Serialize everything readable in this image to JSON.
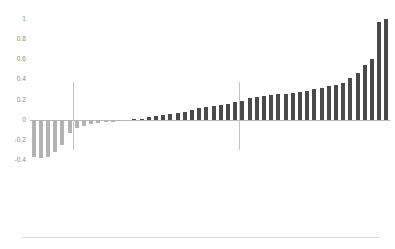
{
  "chart_data": {
    "type": "bar",
    "title": "",
    "subtitle": "",
    "xlabel": "",
    "ylabel": "",
    "ylim": [
      -0.4,
      1.05
    ],
    "yticks": [
      1,
      0.8,
      0.6,
      0.4,
      0.2,
      0,
      -0.2,
      -0.4
    ],
    "ytick_labels": [
      "1",
      "0.8",
      "0.6",
      "0.4",
      "0.2",
      "0",
      "-0.2",
      "-0.4"
    ],
    "grid": false,
    "legend": null,
    "orientation": "vertical",
    "sorted": true,
    "colors": {
      "negative_bar": "#b3b3b3",
      "positive_bar": "#4a4a4a",
      "zero_line": "#b9b9b9",
      "separator_line": "#c2c2c2",
      "tick_text": "#8c8c8c",
      "label_text": "#9a9a9a",
      "background": "#ffffff",
      "footer_rule": "#d9d9d9"
    },
    "separators": [
      {
        "name": "separator-left",
        "after_category_index": 6
      },
      {
        "name": "separator-right",
        "after_category_index": 29
      }
    ],
    "categories": [
      "category-01",
      "category-02",
      "category-03",
      "category-04",
      "category-05",
      "category-06",
      "category-07",
      "category-08",
      "category-09",
      "category-10",
      "category-11",
      "category-12",
      "category-13",
      "category-14",
      "category-15",
      "category-16",
      "category-17",
      "category-18",
      "category-19",
      "category-20",
      "category-21",
      "category-22",
      "category-23",
      "category-24",
      "category-25",
      "category-26",
      "category-27",
      "category-28",
      "category-29",
      "category-30",
      "category-31",
      "category-32",
      "category-33",
      "category-34",
      "category-35",
      "category-36",
      "category-37",
      "category-38",
      "category-39",
      "category-40",
      "category-41",
      "category-42",
      "category-43",
      "category-44",
      "category-45",
      "category-46",
      "category-47",
      "category-48",
      "category-49",
      "category-50"
    ],
    "tick_labels": [
      "",
      "",
      "",
      "",
      "",
      "",
      "",
      "",
      "",
      "",
      "",
      "",
      "",
      "",
      "",
      "",
      "",
      "",
      "",
      "",
      "",
      "",
      "",
      "",
      "",
      "",
      "",
      "",
      "",
      "",
      "",
      "",
      "",
      "",
      "",
      "",
      "",
      "",
      "",
      "",
      "",
      "",
      "",
      "",
      "",
      "",
      "",
      "",
      "",
      ""
    ],
    "values": [
      -0.37,
      -0.38,
      -0.37,
      -0.32,
      -0.25,
      -0.13,
      -0.08,
      -0.06,
      -0.04,
      -0.03,
      -0.02,
      -0.02,
      -0.01,
      -0.01,
      0.005,
      0.01,
      0.03,
      0.04,
      0.05,
      0.06,
      0.07,
      0.08,
      0.1,
      0.12,
      0.13,
      0.14,
      0.15,
      0.16,
      0.18,
      0.19,
      0.22,
      0.23,
      0.24,
      0.25,
      0.26,
      0.26,
      0.27,
      0.28,
      0.29,
      0.31,
      0.32,
      0.33,
      0.34,
      0.36,
      0.41,
      0.46,
      0.54,
      0.6,
      0.97,
      1.0
    ]
  }
}
